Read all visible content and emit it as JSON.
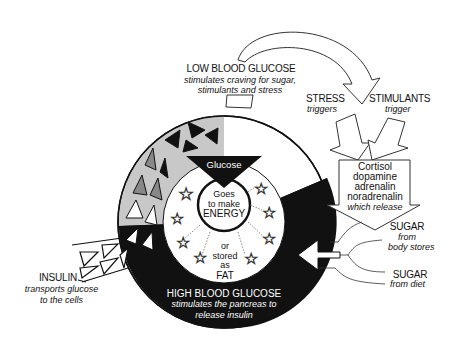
{
  "diagram": {
    "low": {
      "title": "LOW BLOOD GLUCOSE",
      "line1": "stimulates  craving for sugar,",
      "line2": "stimulants and stress"
    },
    "stress": {
      "title": "STRESS",
      "sub": "triggers"
    },
    "stimulants": {
      "title": "STIMULANTS",
      "sub": "trigger"
    },
    "hormones": {
      "l1": "Cortisol",
      "l2": "dopamine",
      "l3": "adrenalin",
      "l4": "noradrenalin",
      "l5": "which release"
    },
    "sugar_stores": {
      "title": "SUGAR",
      "l1": "from",
      "l2": "body stores"
    },
    "sugar_diet": {
      "title": "SUGAR",
      "l1": "from diet"
    },
    "glucose": "Glucose",
    "center": {
      "l1": "Goes",
      "l2": "to make",
      "l3": "ENERGY"
    },
    "fat": {
      "l1": "or",
      "l2": "stored",
      "l3": "as",
      "l4": "FAT"
    },
    "high": {
      "title": "HIGH BLOOD GLUCOSE",
      "line1": "stimulates the pancreas to",
      "line2": "release insulin"
    },
    "insulin": {
      "title": "INSULIN",
      "line1": "transports glucose",
      "line2": "to the cells"
    },
    "colors": {
      "black": "#111111",
      "grey": "#c8c8c8",
      "mid_grey": "#888888",
      "white": "#ffffff"
    }
  }
}
